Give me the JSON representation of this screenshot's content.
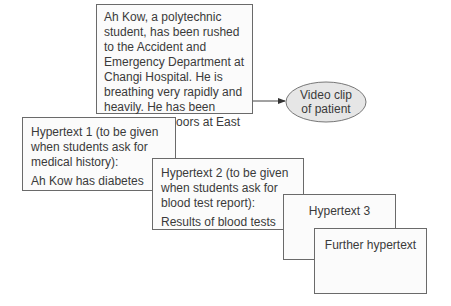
{
  "diagram": {
    "scenario": {
      "text": "Ah Kow, a polytechnic student, has been rushed to the Accident and Emergency Department at Changi Hospital. He is breathing very rapidly and heavily. He has been camping outdoors at East Coast Beach."
    },
    "video": {
      "line1": "Video clip",
      "line2": "of patient"
    },
    "hypertext1": {
      "heading": "Hypertext 1 (to be given when students ask for medical history):",
      "body": "Ah Kow has diabetes"
    },
    "hypertext2": {
      "heading": "Hypertext 2 (to be given when students ask for blood test report):",
      "body": "Results of blood tests"
    },
    "hypertext3": {
      "heading": "Hypertext 3"
    },
    "further": {
      "heading": "Further hypertext"
    },
    "colors": {
      "border": "#6a6a6a",
      "box_fill": "#fbfbfb",
      "ellipse_fill": "#e6e6e6",
      "text": "#3a3a3a"
    }
  }
}
